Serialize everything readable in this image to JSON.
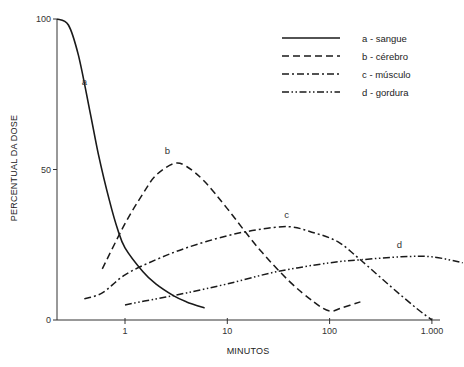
{
  "chart_data": {
    "type": "line",
    "title": "",
    "xlabel": "MINUTOS",
    "ylabel": "PERCENTUAL DA DOSE",
    "xscale": "log",
    "xlim": [
      0.2,
      2000
    ],
    "ylim": [
      0,
      100
    ],
    "grid": false,
    "legend_position": "upper right",
    "x_ticks": [
      {
        "value": 1,
        "label": "1"
      },
      {
        "value": 10,
        "label": "10"
      },
      {
        "value": 100,
        "label": "100"
      },
      {
        "value": 1000,
        "label": "1.000"
      }
    ],
    "y_ticks": [
      {
        "value": 0,
        "label": "0"
      },
      {
        "value": 50,
        "label": "50"
      },
      {
        "value": 100,
        "label": "100"
      }
    ],
    "series": [
      {
        "name": "a - sangue",
        "label": "a",
        "style": "solid",
        "x": [
          0.2,
          0.28,
          0.35,
          0.45,
          0.55,
          0.7,
          0.85,
          1,
          1.5,
          2,
          3,
          4,
          6
        ],
        "values": [
          100,
          98,
          88,
          70,
          55,
          40,
          30,
          24,
          16,
          12,
          8,
          6,
          4
        ],
        "label_pos": {
          "x": 0.4,
          "y": 78
        }
      },
      {
        "name": "b - cérebro",
        "label": "b",
        "style": "dashed",
        "x": [
          0.6,
          1,
          1.5,
          2,
          3,
          4,
          6,
          10,
          20,
          40,
          70,
          100,
          130,
          200
        ],
        "values": [
          17,
          32,
          42,
          48,
          52,
          51,
          46,
          37,
          24,
          13,
          6,
          3,
          4,
          6
        ],
        "label_pos": {
          "x": 2.6,
          "y": 55
        }
      },
      {
        "name": "c - músculo",
        "label": "c",
        "style": "dashdot",
        "x": [
          0.4,
          0.6,
          1,
          2,
          4,
          10,
          20,
          40,
          70,
          120,
          200,
          400,
          700,
          1000
        ],
        "values": [
          7,
          9,
          15,
          20,
          24,
          28,
          30,
          31,
          29,
          26,
          20,
          11,
          4,
          0
        ],
        "label_pos": {
          "x": 38,
          "y": 34
        }
      },
      {
        "name": "d - gordura",
        "label": "d",
        "style": "dashdotdot",
        "x": [
          1,
          2,
          4,
          10,
          30,
          100,
          200,
          500,
          1000,
          2000
        ],
        "values": [
          5,
          7,
          9,
          12,
          16,
          19,
          20,
          21,
          21,
          19
        ],
        "label_pos": {
          "x": 480,
          "y": 24
        }
      }
    ]
  },
  "legend": {
    "items": [
      {
        "label": "a - sangue",
        "style": "solid"
      },
      {
        "label": "b - cérebro",
        "style": "dashed"
      },
      {
        "label": "c - músculo",
        "style": "dashdot"
      },
      {
        "label": "d - gordura",
        "style": "dashdotdot"
      }
    ]
  },
  "colors": {
    "line": "#1a1a1a",
    "axis": "#333333",
    "background": "#ffffff"
  }
}
